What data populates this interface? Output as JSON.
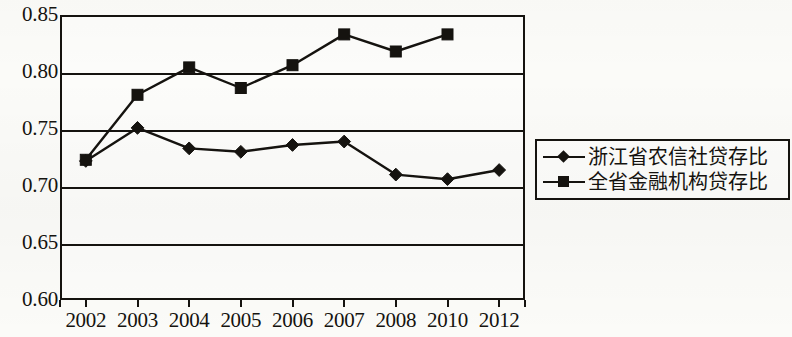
{
  "chart_data": {
    "type": "line",
    "title": "",
    "xlabel": "",
    "ylabel": "",
    "categories": [
      "2002",
      "2003",
      "2004",
      "2005",
      "2006",
      "2007",
      "2008",
      "2010",
      "2012"
    ],
    "ylim": [
      0.6,
      0.85
    ],
    "ytick_labels": [
      "0.85",
      "0.80",
      "0.75",
      "0.70",
      "0.65",
      "0.60"
    ],
    "ytick_values": [
      0.85,
      0.8,
      0.75,
      0.7,
      0.65,
      0.6
    ],
    "grid": true,
    "legend_position": "right",
    "series": [
      {
        "name": "浙江省农信社贷存比",
        "marker": "diamond",
        "color": "#15130f",
        "values": [
          0.722,
          0.751,
          0.733,
          0.73,
          0.736,
          0.739,
          0.71,
          0.706,
          0.714
        ]
      },
      {
        "name": "全省金融机构贷存比",
        "marker": "square",
        "color": "#15130f",
        "values": [
          0.723,
          0.78,
          0.804,
          0.786,
          0.806,
          0.833,
          0.818,
          0.833,
          null
        ]
      }
    ]
  }
}
